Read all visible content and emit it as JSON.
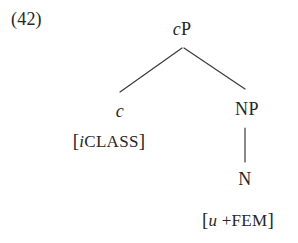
{
  "figure": {
    "example_number": "(42)",
    "type": "syntax-tree",
    "ink_color": "#262626",
    "background_color": "#ffffff",
    "line_color": "#3a3a3a"
  },
  "tree": {
    "root": {
      "label_italic": "c",
      "label_roman": "P",
      "label_full": "cP"
    },
    "left_daughter": {
      "label_italic": "c",
      "label_roman": "",
      "label_full": "c",
      "feature_open_bracket": "[",
      "feature_italic": "i",
      "feature_smallcaps": "CLASS",
      "feature_close_bracket": "]",
      "feature_full": "[iCLASS]"
    },
    "right_daughter": {
      "label_full": "NP",
      "child": {
        "label_full": "N",
        "feature_open_bracket": "[",
        "feature_italic": "u",
        "feature_plus": "+",
        "feature_smallcaps": "FEM",
        "feature_close_bracket": "]",
        "feature_full": "[u +FEM]"
      }
    }
  }
}
